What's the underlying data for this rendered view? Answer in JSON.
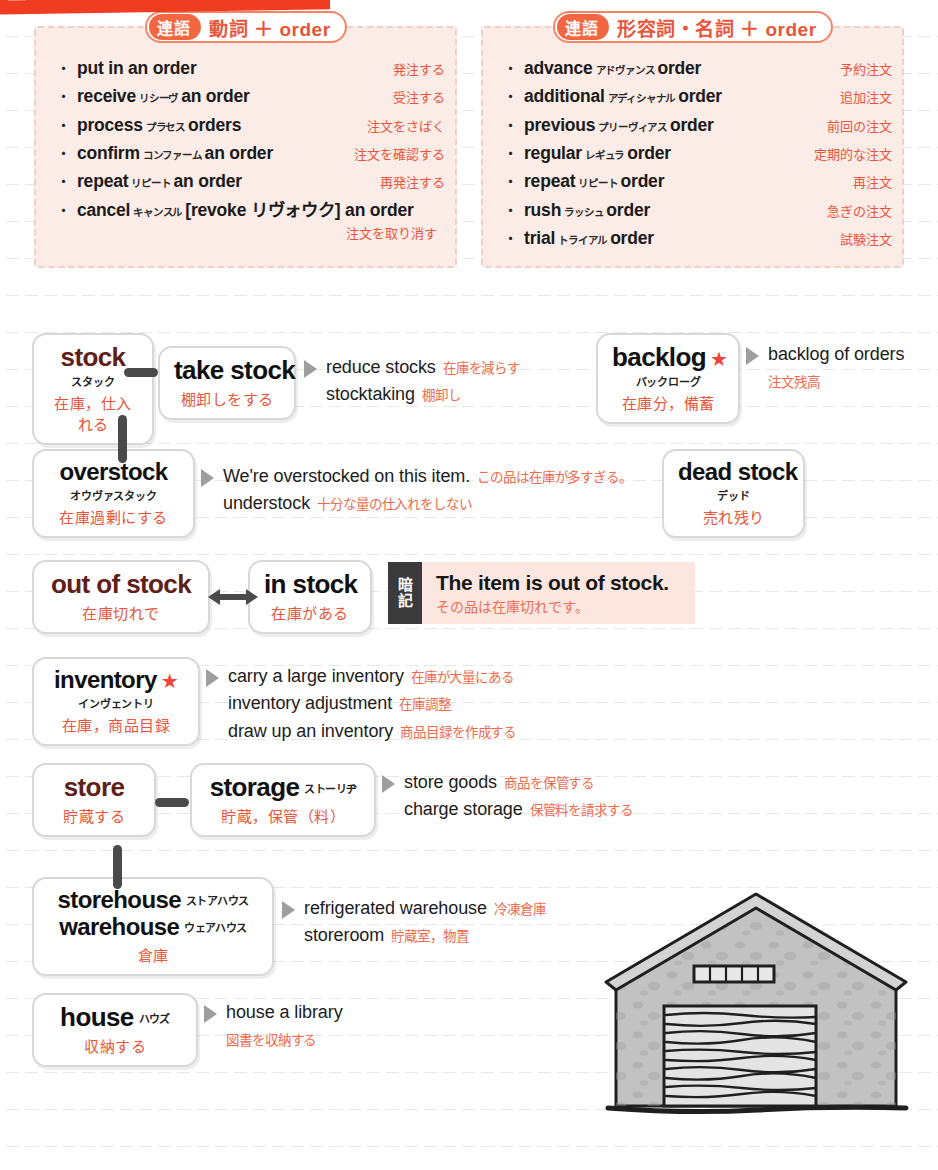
{
  "page": {
    "banner_color": "#f03c20",
    "accent_red": "#e8553a",
    "panel_bg": "#fbece7",
    "box_border": "#d8d8d8"
  },
  "collocations": [
    {
      "tag": "連語",
      "title": "動詞 ＋ order",
      "items": [
        {
          "bullet": "・",
          "pre": "put in an order",
          "kana": "",
          "post": "",
          "gloss": "発注する"
        },
        {
          "bullet": "・",
          "pre": "receive",
          "kana": "リシーヴ",
          "post": "an order",
          "gloss": "受注する"
        },
        {
          "bullet": "・",
          "pre": "process",
          "kana": "プラセス",
          "post": "orders",
          "gloss": "注文をさばく"
        },
        {
          "bullet": "・",
          "pre": "confirm",
          "kana": "コンファーム",
          "post": "an order",
          "gloss": "注文を確認する"
        },
        {
          "bullet": "・",
          "pre": "repeat",
          "kana": "リピート",
          "post": "an order",
          "gloss": "再発注する"
        },
        {
          "bullet": "・",
          "pre": "cancel",
          "kana": "キャンスル",
          "post": "[revoke リヴォウク] an order",
          "gloss": ""
        }
      ],
      "trailing_gloss": "注文を取り消す"
    },
    {
      "tag": "連語",
      "title": "形容詞・名詞 ＋ order",
      "items": [
        {
          "bullet": "・",
          "pre": "advance",
          "kana": "アドヴァンス",
          "post": "order",
          "gloss": "予約注文"
        },
        {
          "bullet": "・",
          "pre": "additional",
          "kana": "アディシャナル",
          "post": "order",
          "gloss": "追加注文"
        },
        {
          "bullet": "・",
          "pre": "previous",
          "kana": "プリーヴィアス",
          "post": "order",
          "gloss": "前回の注文"
        },
        {
          "bullet": "・",
          "pre": "regular",
          "kana": "レギュラ",
          "post": "order",
          "gloss": "定期的な注文"
        },
        {
          "bullet": "・",
          "pre": "repeat",
          "kana": "リピート",
          "post": "order",
          "gloss": "再注文"
        },
        {
          "bullet": "・",
          "pre": "rush",
          "kana": "ラッシュ",
          "post": "order",
          "gloss": "急ぎの注文"
        },
        {
          "bullet": "・",
          "pre": "trial",
          "kana": "トライアル",
          "post": "order",
          "gloss": "試験注文"
        }
      ],
      "trailing_gloss": ""
    }
  ],
  "entries": {
    "stock": {
      "headword": "stock",
      "kana": "スタック",
      "jp": "在庫，仕入れる"
    },
    "take_stock": {
      "headword": "take stock",
      "kana": "",
      "jp": "棚卸しをする"
    },
    "backlog": {
      "headword": "backlog",
      "star": "★",
      "kana": "バックローグ",
      "jp": "在庫分，備蓄"
    },
    "overstock": {
      "headword": "overstock",
      "kana": "オウヴァスタック",
      "jp": "在庫過剰にする"
    },
    "dead_stock": {
      "headword": "dead stock",
      "kana": "デッド",
      "jp": "売れ残り"
    },
    "out_of_stock": {
      "headword": "out of stock",
      "kana": "",
      "jp": "在庫切れで"
    },
    "in_stock": {
      "headword": "in stock",
      "kana": "",
      "jp": "在庫がある"
    },
    "inventory": {
      "headword": "inventory",
      "star": "★",
      "kana": "インヴェントリ",
      "jp": "在庫，商品目録"
    },
    "store": {
      "headword": "store",
      "kana": "",
      "jp": "貯蔵する"
    },
    "storage": {
      "headword": "storage",
      "kana": "ストーリヂ",
      "jp": "貯蔵，保管（料）"
    },
    "storehouse": {
      "headword": "storehouse",
      "kana": "ストアハウス"
    },
    "warehouse": {
      "headword": "warehouse",
      "kana": "ウェアハウス",
      "jp": "倉庫"
    },
    "house": {
      "headword": "house",
      "kana": "ハウズ",
      "jp": "収納する"
    }
  },
  "examples": {
    "take_stock": [
      {
        "en": "reduce stocks",
        "jp": "在庫を減らす"
      },
      {
        "en": "stocktaking",
        "jp": "棚卸し"
      }
    ],
    "backlog": [
      {
        "en": "backlog of orders",
        "jp": ""
      },
      {
        "en": "",
        "jp": "注文残高"
      }
    ],
    "overstock": [
      {
        "en": "We're overstocked on this item.",
        "jp": "この品は在庫が多すぎる。"
      },
      {
        "en": "understock",
        "jp": "十分な量の仕入れをしない"
      }
    ],
    "inventory": [
      {
        "en": "carry a large inventory",
        "jp": "在庫が大量にある"
      },
      {
        "en": "inventory adjustment",
        "jp": "在庫調整"
      },
      {
        "en": "draw up an inventory",
        "jp": "商品目録を作成する"
      }
    ],
    "storage": [
      {
        "en": "store goods",
        "jp": "商品を保管する"
      },
      {
        "en": "charge storage",
        "jp": "保管料を請求する"
      }
    ],
    "warehouse": [
      {
        "en": "refrigerated warehouse",
        "jp": "冷凍倉庫"
      },
      {
        "en": "storeroom",
        "jp": "貯蔵室，物置"
      }
    ],
    "house": [
      {
        "en": "house a library",
        "jp": ""
      },
      {
        "en": "",
        "jp": "図書を収納する"
      }
    ]
  },
  "memo": {
    "tab_char_1": "暗",
    "tab_char_2": "記",
    "en": "The item is out of stock.",
    "jp": "その品は在庫切れです。"
  },
  "illustration": {
    "name": "warehouse-building"
  }
}
